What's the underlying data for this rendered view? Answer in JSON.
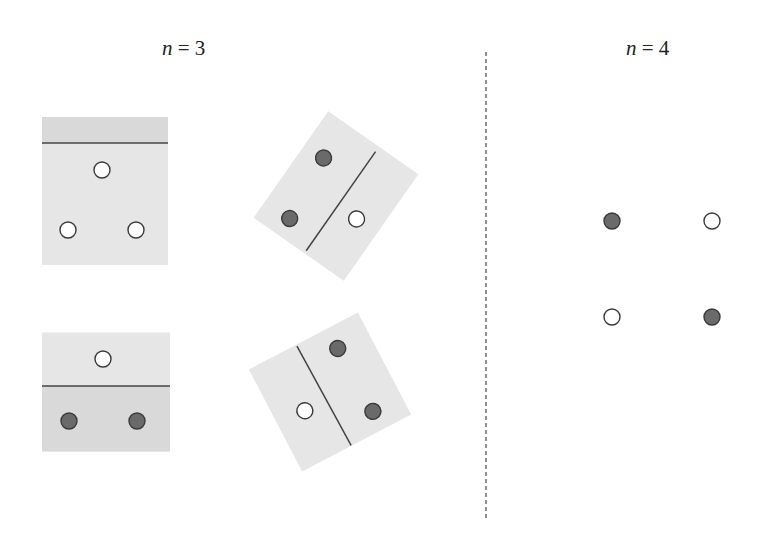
{
  "labels": {
    "left": {
      "var": "n",
      "eq": " = ",
      "value": "3"
    },
    "right": {
      "var": "n",
      "eq": " = ",
      "value": "4"
    }
  },
  "colors": {
    "panel": "#e6e6e6",
    "panel_shade": "#d9d9d9",
    "line": "#444444",
    "dark_point": "#6a6a6a",
    "point_stroke": "#3a3a3a",
    "white_point": "#ffffff",
    "divider": "#555555"
  },
  "divider": {
    "x": 486,
    "y1": 52,
    "y2": 518
  },
  "n3_panels": [
    {
      "name": "panel-top-left",
      "cx": 105,
      "cy": 191,
      "w": 126,
      "h": 148,
      "angle": 0,
      "shade": {
        "u1": -63,
        "v1": -74,
        "u2": 63,
        "v2": -48
      },
      "line": {
        "u1": -63,
        "v1": -48,
        "u2": 63,
        "v2": -48
      },
      "points": [
        {
          "u": -3,
          "v": -21,
          "color": "white"
        },
        {
          "u": -37,
          "v": 39,
          "color": "white"
        },
        {
          "u": 31,
          "v": 39,
          "color": "white"
        }
      ]
    },
    {
      "name": "panel-top-right",
      "cx": 336,
      "cy": 196,
      "w": 130,
      "h": 110,
      "angle": -55,
      "shade": null,
      "line": {
        "u1": -62,
        "v1": 7,
        "u2": 59,
        "v2": 7
      },
      "points": [
        {
          "u": 24,
          "v": -32,
          "color": "dark"
        },
        {
          "u": -45,
          "v": -25,
          "color": "dark"
        },
        {
          "u": -7,
          "v": 30,
          "color": "white"
        }
      ]
    },
    {
      "name": "panel-bottom-left",
      "cx": 106,
      "cy": 392,
      "w": 128,
      "h": 119,
      "angle": 0,
      "shade": {
        "u1": -64,
        "v1": -6,
        "u2": 64,
        "v2": 59.5
      },
      "line": {
        "u1": -64,
        "v1": -6,
        "u2": 64,
        "v2": -6
      },
      "points": [
        {
          "u": -3,
          "v": -33,
          "color": "white"
        },
        {
          "u": -37,
          "v": 29,
          "color": "dark"
        },
        {
          "u": 31,
          "v": 29,
          "color": "dark"
        }
      ]
    },
    {
      "name": "panel-bottom-right",
      "cx": 330,
      "cy": 392,
      "w": 123,
      "h": 115,
      "angle": -27.6,
      "shade": null,
      "line": {
        "u1": -8,
        "v1": -56,
        "u2": -6,
        "v2": 57
      },
      "points": [
        {
          "u": 27,
          "v": -35,
          "color": "dark"
        },
        {
          "u": 29,
          "v": 37,
          "color": "dark"
        },
        {
          "u": -31,
          "v": 5,
          "color": "white"
        }
      ]
    }
  ],
  "n4_points": [
    {
      "x": 612,
      "y": 221,
      "color": "dark"
    },
    {
      "x": 712,
      "y": 221,
      "color": "white"
    },
    {
      "x": 612,
      "y": 317,
      "color": "white"
    },
    {
      "x": 712,
      "y": 317,
      "color": "dark"
    }
  ],
  "point_radius": 8
}
